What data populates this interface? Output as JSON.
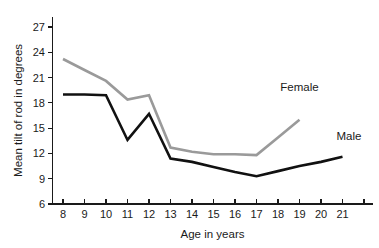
{
  "chart_data": {
    "type": "line",
    "title": "",
    "xlabel": "Age in years",
    "ylabel": "Mean tilt of rod in degrees",
    "xlim": [
      7.4,
      22.4
    ],
    "ylim": [
      6,
      28.2
    ],
    "grid": false,
    "legend_position": "inline-annotations",
    "x_ticks": [
      8,
      9,
      10,
      11,
      12,
      13,
      14,
      15,
      16,
      17,
      18,
      19,
      20,
      21,
      22
    ],
    "x_tick_labels": [
      "8",
      "9",
      "10",
      "11",
      "12",
      "13",
      "14",
      "15",
      "16",
      "17",
      "18",
      "19",
      "20",
      "21",
      ""
    ],
    "y_ticks": [
      6,
      9,
      12,
      15,
      18,
      21,
      24,
      27
    ],
    "y_tick_labels": [
      "6",
      "9",
      "12",
      "15",
      "18",
      "21",
      "24",
      "27"
    ],
    "series": [
      {
        "name": "Female",
        "color": "#9a9a9a",
        "line_width": 2.6,
        "label_text": "Female",
        "label_x": 19.0,
        "label_y": 19.4,
        "x": [
          8,
          9,
          10,
          11,
          12,
          13,
          14,
          15,
          16,
          17,
          18,
          19
        ],
        "values": [
          23.2,
          21.9,
          20.6,
          18.4,
          18.9,
          12.7,
          12.2,
          11.9,
          11.9,
          11.8,
          13.9,
          16.0
        ]
      },
      {
        "name": "Male",
        "color": "#111111",
        "line_width": 2.6,
        "label_text": "Male",
        "label_x": 21.3,
        "label_y": 13.6,
        "x": [
          8,
          9,
          10,
          11,
          12,
          13,
          14,
          15,
          16,
          17,
          18,
          19,
          20,
          21
        ],
        "values": [
          19.0,
          19.0,
          18.9,
          13.6,
          16.7,
          11.4,
          11.0,
          10.4,
          9.8,
          9.3,
          9.9,
          10.5,
          11.0,
          11.6
        ]
      }
    ]
  }
}
